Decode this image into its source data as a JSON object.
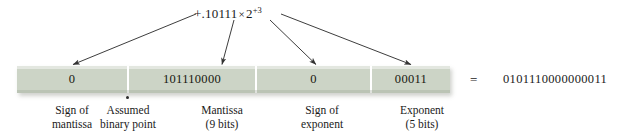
{
  "figure": {
    "formula": {
      "mantissa_sign": "+",
      "mantissa_text": ".10111",
      "times": "×",
      "base": "2",
      "exponent": "+3",
      "full": "+.10111 × 2^+3"
    },
    "bar": {
      "background_color": "#ccd4c6",
      "divider_color": "#ffffff",
      "cells": [
        {
          "name": "sign-of-mantissa",
          "value": "0"
        },
        {
          "name": "mantissa",
          "value": "101110000"
        },
        {
          "name": "sign-of-exponent",
          "value": "0"
        },
        {
          "name": "exponent",
          "value": "00011"
        }
      ]
    },
    "equals_sign": "=",
    "result": "0101110000000011",
    "captions": [
      {
        "line1": "Sign of",
        "line2": "mantissa"
      },
      {
        "line1": "Assumed",
        "line2": "binary point"
      },
      {
        "line1": "Mantissa",
        "line2": "(9 bits)"
      },
      {
        "line1": "Sign of",
        "line2": "exponent"
      },
      {
        "line1": "Exponent",
        "line2": "(5 bits)"
      }
    ],
    "colors": {
      "bar_fill": "#ccd4c6",
      "text": "#1a1a1a",
      "arrow": "#333333",
      "page_background": "#ffffff"
    }
  }
}
